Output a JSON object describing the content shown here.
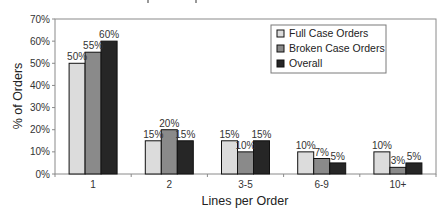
{
  "chart_data": {
    "type": "bar",
    "title": "",
    "xlabel": "Lines per Order",
    "ylabel": "% of Orders",
    "ylim": [
      0,
      70
    ],
    "yticks": [
      "0%",
      "10%",
      "20%",
      "30%",
      "40%",
      "50%",
      "60%",
      "70%"
    ],
    "grid": false,
    "legend_position": "upper right (inside plot)",
    "categories": [
      "1",
      "2",
      "3-5",
      "6-9",
      "10+"
    ],
    "series": [
      {
        "name": "Full Case Orders",
        "color": "#dcdcdc",
        "values": [
          50,
          15,
          15,
          10,
          10
        ],
        "labels": [
          "50%",
          "15%",
          "15%",
          "10%",
          "10%"
        ]
      },
      {
        "name": "Broken Case Orders",
        "color": "#8a8a8a",
        "values": [
          55,
          20,
          10,
          7,
          3
        ],
        "labels": [
          "55%",
          "20%",
          "10%",
          "7%",
          "3%"
        ]
      },
      {
        "name": "Overall",
        "color": "#262626",
        "values": [
          60,
          15,
          15,
          5,
          5
        ],
        "labels": [
          "60%",
          "15%",
          "15%",
          "5%",
          "5%"
        ]
      }
    ]
  }
}
